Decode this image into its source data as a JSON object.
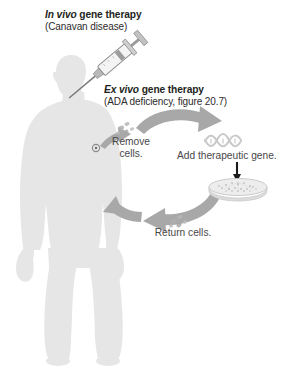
{
  "figure": {
    "width": 297,
    "height": 373,
    "background": "#ffffff"
  },
  "colors": {
    "body_silhouette": "#e6e6e6",
    "body_silhouette_edge": "#dcdcdc",
    "arrow_gray": "#a8a8a8",
    "arrow_gray_dark": "#9a9a9a",
    "text_dark": "#231f20",
    "text_gray": "#4a4749",
    "dna_gray": "#c9c9c9",
    "dish_gray": "#d2d2d2",
    "cell_gray": "#b5b5b5",
    "syringe_gray": "#8f8f8f",
    "syringe_barrel": "#f2f2f2",
    "needle_gray": "#6e6e6e",
    "small_arrow": "#000000"
  },
  "titles": {
    "in_vivo": {
      "emphasis": "In vivo",
      "rest": " gene therapy",
      "line1_full": "In vivo gene therapy",
      "line2": "(Canavan disease)"
    },
    "ex_vivo": {
      "emphasis": "Ex vivo",
      "rest": " gene therapy",
      "line1_full": "Ex vivo gene therapy",
      "line2": "(ADA deficiency, figure 20.7)"
    }
  },
  "steps": {
    "remove_cells": "Remove cells.",
    "add_gene": "Add therapeutic gene.",
    "return_cells": "Return cells."
  },
  "icons": {
    "syringe": "syringe-icon",
    "dna": "dna-helix-icon",
    "petri_dish": "petri-dish-icon",
    "cells_removed": "cell-cluster-icon",
    "cells_returned": "cell-cluster-icon",
    "injection_site": "injection-site-icon",
    "human": "human-silhouette-icon",
    "arrow_top": "curved-arrow-right-icon",
    "arrow_bottom": "curved-arrow-left-icon",
    "arrow_arm": "short-arrow-up-right-icon",
    "arrow_down": "arrow-down-icon"
  }
}
